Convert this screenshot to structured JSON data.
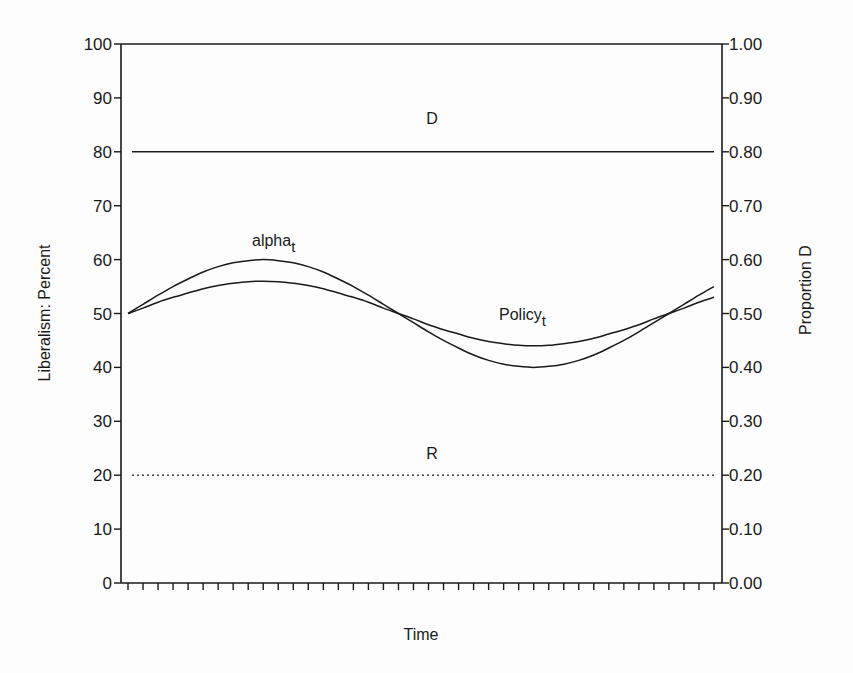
{
  "chart_data": {
    "type": "line",
    "title": "",
    "xlabel": "Time",
    "ylabel": "Liberalism: Percent",
    "y2label": "Proportion D",
    "ylim": [
      0,
      100
    ],
    "y2lim": [
      0.0,
      1.0
    ],
    "yticks": [
      "0",
      "10",
      "20",
      "30",
      "40",
      "50",
      "60",
      "70",
      "80",
      "90",
      "100"
    ],
    "y2ticks": [
      "0.00",
      "0.10",
      "0.20",
      "0.30",
      "0.40",
      "0.50",
      "0.60",
      "0.70",
      "0.80",
      "0.90",
      "1.00"
    ],
    "x_tick_count": 40,
    "x": [
      0,
      1,
      2,
      3,
      4,
      5,
      6,
      7,
      8,
      9,
      10,
      11,
      12,
      13,
      14,
      15,
      16,
      17,
      18,
      19,
      20,
      21,
      22,
      23,
      24,
      25,
      26,
      27,
      28,
      29,
      30,
      31,
      32,
      33,
      34,
      35,
      36,
      37,
      38,
      39
    ],
    "grid": false,
    "legend": "inline labels",
    "series": [
      {
        "name": "alpha_t",
        "label": "alpha",
        "subscript": "t",
        "style": "solid",
        "values": [
          50.0,
          51.7,
          53.4,
          55.0,
          56.4,
          57.7,
          58.7,
          59.4,
          59.8,
          60.0,
          59.8,
          59.4,
          58.7,
          57.7,
          56.4,
          55.0,
          53.4,
          51.7,
          50.0,
          48.3,
          46.6,
          45.0,
          43.6,
          42.3,
          41.3,
          40.6,
          40.2,
          40.0,
          40.2,
          40.6,
          41.3,
          42.3,
          43.6,
          45.0,
          46.6,
          48.3,
          50.0,
          51.7,
          53.4,
          55.0
        ]
      },
      {
        "name": "Policy_t",
        "label": "Policy",
        "subscript": "t",
        "style": "solid",
        "values": [
          50.0,
          51.0,
          52.1,
          53.0,
          53.8,
          54.6,
          55.2,
          55.6,
          55.9,
          56.0,
          55.9,
          55.6,
          55.2,
          54.6,
          53.8,
          53.0,
          52.1,
          51.0,
          50.0,
          49.0,
          47.9,
          47.0,
          46.2,
          45.4,
          44.8,
          44.4,
          44.1,
          44.0,
          44.1,
          44.4,
          44.8,
          45.4,
          46.2,
          47.0,
          47.9,
          49.0,
          50.0,
          51.0,
          52.1,
          53.0
        ]
      },
      {
        "name": "D",
        "label": "D",
        "style": "solid",
        "values": [
          80,
          80,
          80,
          80,
          80,
          80,
          80,
          80,
          80,
          80,
          80,
          80,
          80,
          80,
          80,
          80,
          80,
          80,
          80,
          80,
          80,
          80,
          80,
          80,
          80,
          80,
          80,
          80,
          80,
          80,
          80,
          80,
          80,
          80,
          80,
          80,
          80,
          80,
          80,
          80
        ]
      },
      {
        "name": "R",
        "label": "R",
        "style": "dotted",
        "values": [
          20,
          20,
          20,
          20,
          20,
          20,
          20,
          20,
          20,
          20,
          20,
          20,
          20,
          20,
          20,
          20,
          20,
          20,
          20,
          20,
          20,
          20,
          20,
          20,
          20,
          20,
          20,
          20,
          20,
          20,
          20,
          20,
          20,
          20,
          20,
          20,
          20,
          20,
          20,
          20
        ]
      }
    ]
  },
  "labels": {
    "xlabel": "Time",
    "ylabel": "Liberalism: Percent",
    "y2label": "Proportion D",
    "D": "D",
    "R": "R",
    "alpha": "alpha",
    "alpha_sub": "t",
    "policy": "Policy",
    "policy_sub": "t"
  },
  "colors": {
    "ink": "#1a1a1a",
    "background": "#fdfdfd"
  }
}
